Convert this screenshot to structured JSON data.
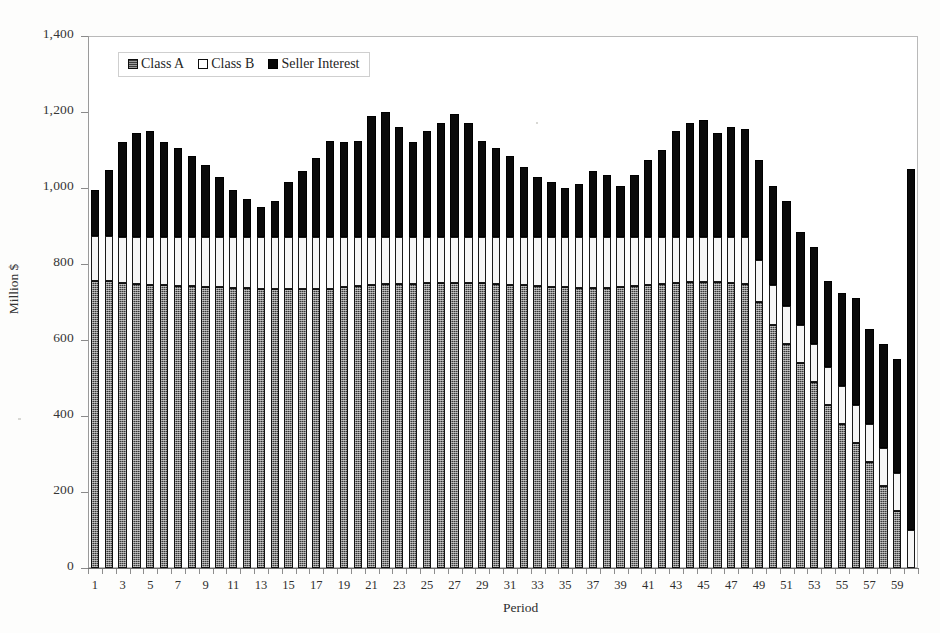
{
  "chart_data": {
    "type": "bar",
    "stacked": true,
    "title": "",
    "subtitle": "",
    "xlabel": "Period",
    "ylabel": "Million $",
    "ylim": [
      0,
      1400
    ],
    "ytick_step": 200,
    "ytick_labels": [
      "1,400",
      "1,200",
      "1,000",
      "800",
      "600",
      "400",
      "200",
      "0"
    ],
    "ytick_values": [
      1400,
      1200,
      1000,
      800,
      600,
      400,
      200,
      0
    ],
    "grid": false,
    "legend_position": "top-left",
    "xtick_labels": [
      "1",
      "3",
      "5",
      "7",
      "9",
      "11",
      "13",
      "15",
      "17",
      "19",
      "21",
      "23",
      "25",
      "27",
      "29",
      "31",
      "33",
      "35",
      "37",
      "39",
      "41",
      "43",
      "45",
      "47",
      "49",
      "51",
      "53",
      "55",
      "57",
      "59"
    ],
    "x": [
      1,
      2,
      3,
      4,
      5,
      6,
      7,
      8,
      9,
      10,
      11,
      12,
      13,
      14,
      15,
      16,
      17,
      18,
      19,
      20,
      21,
      22,
      23,
      24,
      25,
      26,
      27,
      28,
      29,
      30,
      31,
      32,
      33,
      34,
      35,
      36,
      37,
      38,
      39,
      40,
      41,
      42,
      43,
      44,
      45,
      46,
      47,
      48,
      49,
      50,
      51,
      52,
      53,
      54,
      55,
      56,
      57,
      58,
      59,
      60
    ],
    "series": [
      {
        "name": "Class A",
        "color": "#3a3a3a",
        "fill": "dark-checkered",
        "values": [
          755,
          755,
          750,
          748,
          745,
          745,
          742,
          742,
          740,
          740,
          738,
          738,
          735,
          735,
          735,
          735,
          735,
          735,
          740,
          742,
          745,
          748,
          748,
          748,
          750,
          750,
          750,
          750,
          750,
          748,
          745,
          745,
          742,
          740,
          740,
          738,
          738,
          738,
          740,
          742,
          745,
          748,
          750,
          752,
          752,
          752,
          750,
          748,
          700,
          640,
          590,
          540,
          490,
          430,
          380,
          330,
          280,
          215,
          150,
          0
        ]
      },
      {
        "name": "Class B",
        "color": "#f6f6f6",
        "fill": "white-outlined",
        "values": [
          118,
          118,
          120,
          122,
          125,
          125,
          128,
          128,
          130,
          130,
          132,
          132,
          135,
          135,
          135,
          135,
          135,
          135,
          130,
          128,
          125,
          122,
          122,
          122,
          120,
          120,
          120,
          120,
          120,
          122,
          125,
          125,
          128,
          130,
          130,
          132,
          132,
          132,
          130,
          128,
          125,
          122,
          120,
          118,
          118,
          118,
          120,
          122,
          110,
          105,
          100,
          100,
          100,
          100,
          100,
          100,
          100,
          100,
          100,
          100
        ]
      },
      {
        "name": "Seller Interest",
        "color": "#0a0a0a",
        "fill": "solid-black",
        "values": [
          122,
          175,
          250,
          275,
          280,
          250,
          235,
          215,
          190,
          160,
          125,
          100,
          80,
          95,
          145,
          175,
          210,
          255,
          250,
          255,
          320,
          330,
          290,
          250,
          280,
          300,
          325,
          300,
          255,
          235,
          215,
          185,
          160,
          145,
          130,
          140,
          175,
          165,
          135,
          165,
          205,
          230,
          280,
          300,
          310,
          275,
          290,
          285,
          265,
          260,
          275,
          245,
          255,
          225,
          245,
          280,
          250,
          275,
          300,
          950
        ]
      }
    ],
    "totals": [
      995,
      1048,
      1120,
      1145,
      1150,
      1120,
      1105,
      1085,
      1060,
      1030,
      995,
      970,
      950,
      965,
      1015,
      1045,
      1080,
      1128,
      1120,
      1125,
      1190,
      1200,
      1160,
      1120,
      1150,
      1170,
      1195,
      1170,
      1125,
      1105,
      1085,
      1055,
      1030,
      1015,
      970,
      1010,
      1045,
      1035,
      1005,
      1035,
      1075,
      1100,
      1150,
      1170,
      1180,
      1145,
      1160,
      1155,
      1075,
      1005,
      965,
      885,
      845,
      755,
      725,
      710,
      630,
      590,
      550,
      1050
    ]
  },
  "legend": {
    "items": [
      {
        "label": "Class A"
      },
      {
        "label": "Class B"
      },
      {
        "label": "Seller Interest"
      }
    ]
  }
}
